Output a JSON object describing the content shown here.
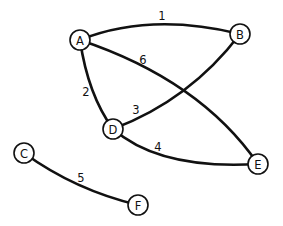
{
  "graph": {
    "type": "undirected-weighted-graph",
    "nodes": [
      {
        "id": "A",
        "label": "A",
        "x": 80,
        "y": 40
      },
      {
        "id": "B",
        "label": "B",
        "x": 240,
        "y": 34
      },
      {
        "id": "D",
        "label": "D",
        "x": 113,
        "y": 129
      },
      {
        "id": "E",
        "label": "E",
        "x": 258,
        "y": 164
      },
      {
        "id": "C",
        "label": "C",
        "x": 24,
        "y": 153
      },
      {
        "id": "F",
        "label": "F",
        "x": 138,
        "y": 205
      }
    ],
    "edges": [
      {
        "from": "A",
        "to": "B",
        "weight": "1",
        "path": "M80,40 Q150,12 240,34",
        "label_x": 162,
        "label_y": 16
      },
      {
        "from": "A",
        "to": "D",
        "weight": "2",
        "path": "M80,40 Q88,95 113,129",
        "label_x": 86,
        "label_y": 92
      },
      {
        "from": "D",
        "to": "B",
        "weight": "3",
        "path": "M113,129 Q190,100 240,34",
        "label_x": 136,
        "label_y": 110
      },
      {
        "from": "D",
        "to": "E",
        "weight": "4",
        "path": "M113,129 Q160,170 258,164",
        "label_x": 158,
        "label_y": 147
      },
      {
        "from": "C",
        "to": "F",
        "weight": "5",
        "path": "M24,153 Q75,190 138,205",
        "label_x": 81,
        "label_y": 178
      },
      {
        "from": "A",
        "to": "E",
        "weight": "6",
        "path": "M80,40 Q200,80 258,164",
        "label_x": 143,
        "label_y": 60
      }
    ],
    "node_radius": 10
  }
}
